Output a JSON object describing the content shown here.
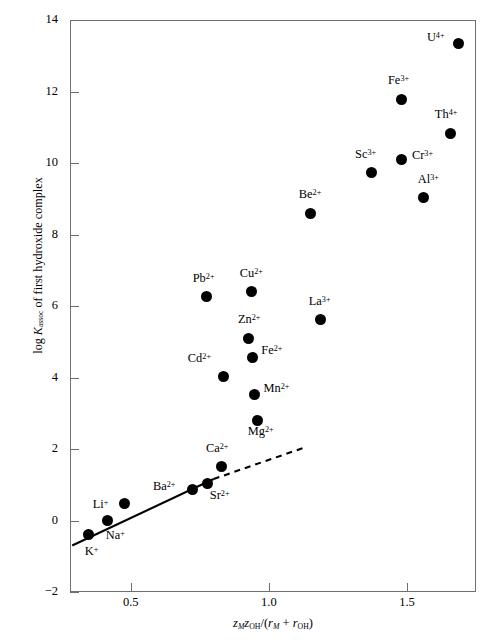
{
  "chart_data": {
    "type": "scatter",
    "title": "",
    "xlabel": "zMzOH/(rM + rOH)",
    "ylabel": "log Kassoc of first hydroxide complex",
    "xlim": [
      0.28,
      1.75
    ],
    "ylim": [
      -2,
      14
    ],
    "xticks": [
      "0.5",
      "1.0",
      "1.5"
    ],
    "xtick_values": [
      0.5,
      1.0,
      1.5
    ],
    "yticks": [
      "14",
      "12",
      "10",
      "8",
      "6",
      "4",
      "2",
      "0",
      "−2"
    ],
    "ytick_values": [
      14,
      12,
      10,
      8,
      6,
      4,
      2,
      0,
      -2
    ],
    "grid": false,
    "legend": false,
    "marker_color": "#000000",
    "axis_color": "#6f6f6f",
    "points": [
      {
        "label": "K",
        "charge": "+",
        "x": 0.348,
        "y": -0.4,
        "lx": -4,
        "ly": 14
      },
      {
        "label": "Na",
        "charge": "+",
        "x": 0.417,
        "y": 0.0,
        "lx": -2,
        "ly": 12
      },
      {
        "label": "Li",
        "charge": "+",
        "x": 0.478,
        "y": 0.47,
        "lx": -32,
        "ly": -2
      },
      {
        "label": "Ba",
        "charge": "2+",
        "x": 0.725,
        "y": 0.88,
        "lx": -40,
        "ly": -5
      },
      {
        "label": "Sr",
        "charge": "2+",
        "x": 0.779,
        "y": 1.03,
        "lx": 2,
        "ly": 9
      },
      {
        "label": "Ca",
        "charge": "2+",
        "x": 0.83,
        "y": 1.52,
        "lx": -16,
        "ly": -20
      },
      {
        "label": "Mg",
        "charge": "2+",
        "x": 0.96,
        "y": 2.81,
        "lx": -10,
        "ly": 9
      },
      {
        "label": "Mn",
        "charge": "2+",
        "x": 0.948,
        "y": 3.52,
        "lx": 9,
        "ly": -9
      },
      {
        "label": "Cd",
        "charge": "2+",
        "x": 0.837,
        "y": 4.03,
        "lx": -36,
        "ly": -20
      },
      {
        "label": "Fe",
        "charge": "2+",
        "x": 0.94,
        "y": 4.56,
        "lx": 9,
        "ly": -9
      },
      {
        "label": "Zn",
        "charge": "2+",
        "x": 0.928,
        "y": 5.1,
        "lx": -11,
        "ly": -21
      },
      {
        "label": "La",
        "charge": "3+",
        "x": 1.188,
        "y": 5.63,
        "lx": -12,
        "ly": -20
      },
      {
        "label": "Pb",
        "charge": "2+",
        "x": 0.775,
        "y": 6.26,
        "lx": -14,
        "ly": -21
      },
      {
        "label": "Cu",
        "charge": "2+",
        "x": 0.938,
        "y": 6.4,
        "lx": -12,
        "ly": -21
      },
      {
        "label": "Be",
        "charge": "2+",
        "x": 1.152,
        "y": 8.59,
        "lx": -12,
        "ly": -21
      },
      {
        "label": "Al",
        "charge": "3+",
        "x": 1.561,
        "y": 9.03,
        "lx": -6,
        "ly": -21
      },
      {
        "label": "Cr",
        "charge": "3+",
        "x": 1.482,
        "y": 10.1,
        "lx": 10,
        "ly": -6
      },
      {
        "label": "Sc",
        "charge": "3+",
        "x": 1.37,
        "y": 9.73,
        "lx": -16,
        "ly": -21
      },
      {
        "label": "Th",
        "charge": "4+",
        "x": 1.659,
        "y": 10.83,
        "lx": -16,
        "ly": -21
      },
      {
        "label": "Fe",
        "charge": "3+",
        "x": 1.482,
        "y": 11.79,
        "lx": -14,
        "ly": -21
      },
      {
        "label": "U",
        "charge": "4+",
        "x": 1.688,
        "y": 13.35,
        "lx": -32,
        "ly": -8
      }
    ],
    "trend_line": {
      "solid": {
        "x1": 0.288,
        "y1": -0.7,
        "x2": 0.8,
        "y2": 1.16
      },
      "dashed": {
        "x1": 0.8,
        "y1": 1.16,
        "x2": 1.128,
        "y2": 2.04
      },
      "color": "#000000"
    }
  },
  "axis": {
    "ylabel_prefix": "log ",
    "ylabel_k": "K",
    "ylabel_sub": "assoc",
    "ylabel_suffix": " of first hydroxide complex",
    "xlabel_z1": "z",
    "xlabel_z1sub": "M",
    "xlabel_z2": "z",
    "xlabel_z2sub": "OH",
    "xlabel_slash": "/(",
    "xlabel_r1": "r",
    "xlabel_r1sub": "M",
    "xlabel_plus": " + ",
    "xlabel_r2": "r",
    "xlabel_r2sub": "OH",
    "xlabel_close": ")"
  }
}
